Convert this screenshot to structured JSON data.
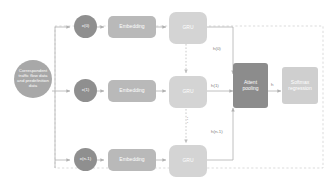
{
  "diagram": {
    "background_color": "#ffffff",
    "colors": {
      "input_circle": "#a8a8a8",
      "x_circle": "#8f8f8f",
      "embedding": "#b9b9b9",
      "gru": "#d4d4d4",
      "attention": "#8c8c8c",
      "softmax": "#cfcfcf",
      "connector": "#b0b0b0",
      "container_border": "#cccccc",
      "label_text": "#7d7d7d",
      "node_text": "#ffffff"
    },
    "input_node": {
      "label": "Correspondent traffic flow data and predefinition data"
    },
    "rows": [
      {
        "x_label": "x(0)",
        "embedding_label": "Embedding",
        "gru_label": "GRU",
        "hidden_label": "h(0)"
      },
      {
        "x_label": "x(1)",
        "embedding_label": "Embedding",
        "gru_label": "GRU",
        "hidden_label": "h(1)"
      },
      {
        "x_label": "x(n-1)",
        "embedding_label": "Embedding",
        "gru_label": "GRU",
        "hidden_label": "h(n-1)"
      }
    ],
    "attention": {
      "label": "Attent pooling",
      "line1": "Attent",
      "line2": "pooling"
    },
    "pooled_output_label": "h",
    "softmax": {
      "label": "Softmax regression",
      "line1": "Softmax",
      "line2": "regression"
    },
    "vertical_ellipsis": "⋮"
  }
}
